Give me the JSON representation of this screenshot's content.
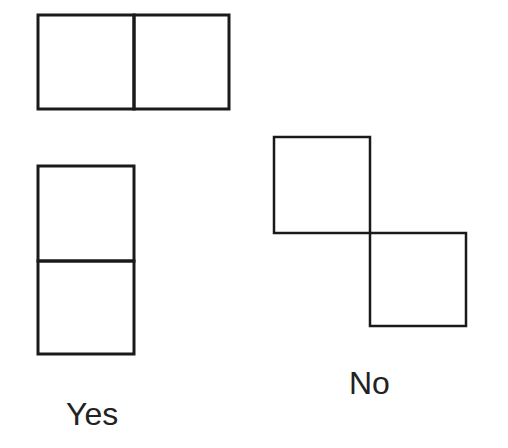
{
  "figure": {
    "stroke_color": "#1a1a1a",
    "background": "#ffffff",
    "yes_label": "Yes",
    "no_label": "No",
    "groups": [
      {
        "name": "horizontal-domino",
        "verdict": "Yes",
        "squares": [
          [
            38,
            15
          ],
          [
            134,
            15
          ]
        ]
      },
      {
        "name": "vertical-domino",
        "verdict": "Yes",
        "squares": [
          [
            38,
            166
          ],
          [
            38,
            261
          ]
        ]
      },
      {
        "name": "corner-touching-squares",
        "verdict": "No",
        "squares": [
          [
            274,
            137
          ],
          [
            370,
            233
          ]
        ]
      }
    ]
  }
}
